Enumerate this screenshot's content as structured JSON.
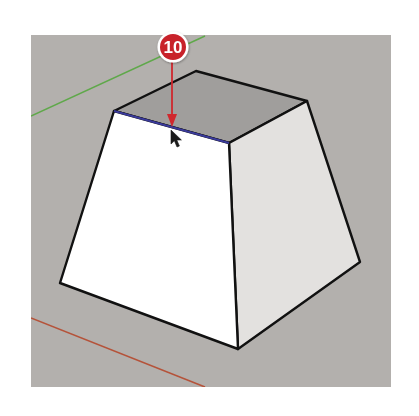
{
  "viewport": {
    "background_color": "#b3b0ad",
    "bounds": {
      "x": 31,
      "y": 35,
      "width": 360,
      "height": 352
    }
  },
  "axes": {
    "green_axis": {
      "color": "#5fa84a",
      "x1": 31,
      "y1": 116,
      "x2": 205,
      "y2": 36
    },
    "red_axis": {
      "color": "#b5533a",
      "x1": 31,
      "y1": 318,
      "x2": 205,
      "y2": 387
    }
  },
  "model": {
    "name": "frustum",
    "top_face": {
      "color": "#a09e9c",
      "points": "196,71 307,101 229,143 114,111"
    },
    "front_face": {
      "color": "#ffffff",
      "points": "114,111 229,143 238,349 60,283"
    },
    "right_face": {
      "color": "#e3e1df",
      "points": "229,143 307,101 360,262 238,349"
    },
    "edge_color": "#111111",
    "highlighted_edge": {
      "color": "#3a3a9a",
      "x1": 114,
      "y1": 111,
      "x2": 229,
      "y2": 143
    }
  },
  "callout": {
    "number": "10",
    "badge_color": "#c8202a",
    "ring_color": "#ffffff",
    "cx": 173,
    "cy": 47,
    "r": 14,
    "arrow_color": "#d0282e",
    "arrow_to": {
      "x": 172,
      "y": 127
    }
  },
  "cursor": {
    "icon": "arrow-pointer-icon",
    "x": 171,
    "y": 130
  }
}
